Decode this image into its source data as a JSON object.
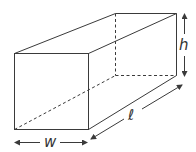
{
  "diagram": {
    "labels": {
      "width": "w",
      "height": "h",
      "length": "ℓ"
    },
    "colors": {
      "line": "#3a3a3a",
      "background": "#ffffff"
    }
  }
}
